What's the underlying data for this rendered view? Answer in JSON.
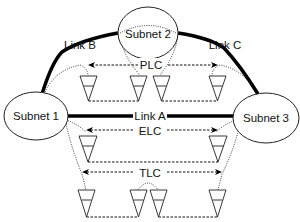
{
  "diagram": {
    "subnets": [
      {
        "id": "subnet1",
        "label": "Subnet 1"
      },
      {
        "id": "subnet2",
        "label": "Subnet 2"
      },
      {
        "id": "subnet3",
        "label": "Subnet 3"
      }
    ],
    "links": [
      {
        "id": "linkA",
        "label": "Link A",
        "from": "subnet1",
        "to": "subnet3"
      },
      {
        "id": "linkB",
        "label": "Link B",
        "from": "subnet1",
        "to": "subnet2"
      },
      {
        "id": "linkC",
        "label": "Link C",
        "from": "subnet2",
        "to": "subnet3"
      }
    ],
    "channels": [
      {
        "id": "plc",
        "label": "PLC"
      },
      {
        "id": "elc",
        "label": "ELC"
      },
      {
        "id": "tlc",
        "label": "TLC"
      }
    ]
  }
}
